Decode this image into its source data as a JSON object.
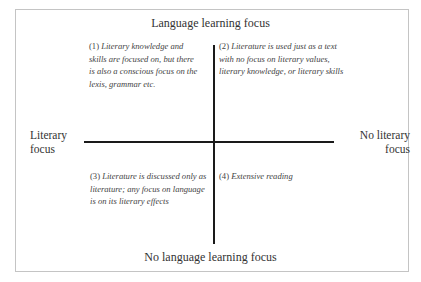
{
  "diagram": {
    "type": "quadrant",
    "axes": {
      "top": "Language learning focus",
      "bottom": "No language learning focus",
      "left": "Literary focus",
      "right": "No literary focus"
    },
    "quadrants": [
      {
        "position": "top-left",
        "number": "(1)",
        "text": "Literary knowledge and skills are focused on, but there is also a conscious focus on the lexis, grammar etc."
      },
      {
        "position": "top-right",
        "number": "(2)",
        "text": "Literature is used just as a text with no focus on literary values, literary knowledge, or literary skills"
      },
      {
        "position": "bottom-left",
        "number": "(3)",
        "text": "Literature is discussed only as literature; any focus on language is on its literary effects"
      },
      {
        "position": "bottom-right",
        "number": "(4)",
        "text": "Extensive reading"
      }
    ]
  },
  "colors": {
    "axis": "#1a1a1a",
    "frame": "#c4c4c4",
    "text": "#333333"
  }
}
